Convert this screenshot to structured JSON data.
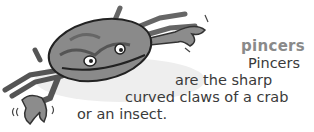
{
  "entry": {
    "headword": "pincers",
    "definition_lines": [
      "Pincers",
      "are the sharp",
      "curved claws of a crab",
      "or an insect."
    ]
  },
  "illustration": {
    "subject": "crab-icon",
    "description": "cartoon crab with raised claws"
  }
}
